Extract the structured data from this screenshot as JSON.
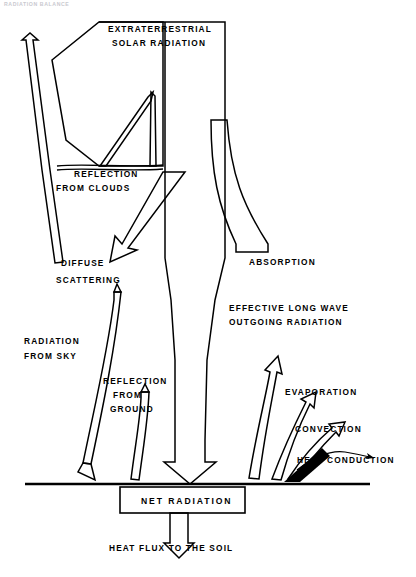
{
  "figure": {
    "running_head": "RADIATION BALANCE",
    "labels": {
      "extraterrestrial": "EXTRATERRESTRIAL",
      "solar_radiation": "SOLAR  RADIATION",
      "reflection": "REFLECTION",
      "from_clouds": "FROM   CLOUDS",
      "diffuse": "DIFFUSE",
      "scattering": "SCATTERING",
      "absorption": "ABSORPTION",
      "effective_long_wave": "EFFECTIVE   LONG   WAVE",
      "outgoing_radiation": "OUTGOING   RADIATION",
      "radiation": "RADIATION",
      "from_sky": "FROM   SKY",
      "reflection_ground_1": "REFLECTION",
      "reflection_ground_2": "FROM",
      "reflection_ground_3": "GROUND",
      "evaporation": "EVAPORATION",
      "convection": "CONVECTION",
      "heat_conduction": "HEAT   CONDUCTION",
      "net_radiation": "NET    RADIATION",
      "heat_flux": "HEAT  FLUX  TO  THE  SOIL"
    },
    "colors": {
      "ink": "#000000",
      "paper": "#ffffff",
      "faint": "#c9c9cf"
    }
  }
}
